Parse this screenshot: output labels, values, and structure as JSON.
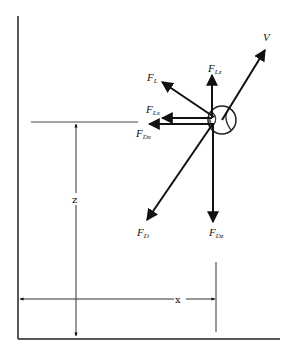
{
  "diagram": {
    "type": "free-body force diagram of a spinning ball in flight",
    "vectors": [
      {
        "id": "V",
        "label": "V",
        "sub": ""
      },
      {
        "id": "FL",
        "label": "F",
        "sub": "L"
      },
      {
        "id": "FLz",
        "label": "F",
        "sub": "Lz"
      },
      {
        "id": "FLx",
        "label": "F",
        "sub": "Lx"
      },
      {
        "id": "FDx",
        "label": "F",
        "sub": "Dx"
      },
      {
        "id": "FD",
        "label": "F",
        "sub": "D"
      },
      {
        "id": "FDz",
        "label": "F",
        "sub": "Dz"
      }
    ],
    "dimensions": {
      "z_label": "z",
      "x_label": "x"
    }
  }
}
